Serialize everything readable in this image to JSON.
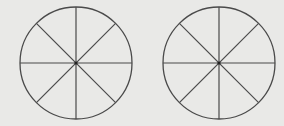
{
  "diagram": {
    "background": "#e9e9e7",
    "stroke_color": "#4a4a4a",
    "circles": [
      {
        "id": "left-circle",
        "cx": 76,
        "cy": 63,
        "r": 56,
        "sectors": 8
      },
      {
        "id": "right-circle",
        "cx": 219,
        "cy": 63,
        "r": 56,
        "sectors": 8
      }
    ]
  }
}
